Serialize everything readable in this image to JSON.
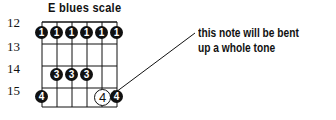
{
  "diagram": {
    "title": "E blues scale",
    "frets": [
      {
        "label": "12",
        "y": 22
      },
      {
        "label": "13",
        "y": 44
      },
      {
        "label": "14",
        "y": 66
      },
      {
        "label": "15",
        "y": 88
      }
    ],
    "strings_x": [
      42,
      57,
      72,
      87,
      102,
      117
    ],
    "notes": [
      {
        "string": 1,
        "fret": 12,
        "finger": "1"
      },
      {
        "string": 2,
        "fret": 12,
        "finger": "1"
      },
      {
        "string": 3,
        "fret": 12,
        "finger": "1"
      },
      {
        "string": 4,
        "fret": 12,
        "finger": "1"
      },
      {
        "string": 5,
        "fret": 12,
        "finger": "1"
      },
      {
        "string": 6,
        "fret": 12,
        "finger": "1"
      },
      {
        "string": 2,
        "fret": 14,
        "finger": "3"
      },
      {
        "string": 3,
        "fret": 14,
        "finger": "3"
      },
      {
        "string": 4,
        "fret": 14,
        "finger": "3"
      },
      {
        "string": 1,
        "fret": 15,
        "finger": "4"
      },
      {
        "string": 6,
        "fret": 15,
        "finger": "4"
      }
    ],
    "bend_note": {
      "string": 5,
      "fret": 15,
      "finger": "4",
      "style": "open-circle"
    },
    "annotation": {
      "line1": "this note will be bent",
      "line2": "up a whole tone"
    }
  }
}
